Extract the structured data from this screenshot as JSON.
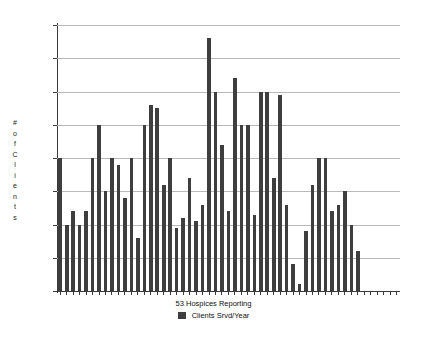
{
  "chart_data": {
    "type": "bar",
    "title": "",
    "xlabel": "53 Hospices Reporting",
    "ylabel": "# of Clients",
    "ylim": [
      0,
      400
    ],
    "ytick_labels": [
      "400",
      "350",
      "300",
      "250",
      "200",
      "150",
      "100",
      "50",
      "0"
    ],
    "ytick_values": [
      400,
      350,
      300,
      250,
      200,
      150,
      100,
      50,
      0
    ],
    "grid": true,
    "legend_position": "bottom-center",
    "legend": [
      "Clients Srvd/Year"
    ],
    "series": [
      {
        "name": "Clients Srvd/Year",
        "color": "#3e3e3e",
        "values": [
          200,
          100,
          120,
          100,
          120,
          200,
          250,
          150,
          200,
          190,
          140,
          200,
          80,
          250,
          280,
          275,
          160,
          200,
          95,
          110,
          170,
          105,
          130,
          380,
          300,
          220,
          120,
          320,
          250,
          250,
          115,
          300,
          300,
          170,
          295,
          130,
          40,
          10,
          90,
          160,
          200,
          200,
          120,
          130,
          150,
          100,
          60
        ]
      }
    ],
    "categories": [
      "1",
      "2",
      "3",
      "4",
      "5",
      "6",
      "7",
      "8",
      "9",
      "10",
      "11",
      "12",
      "13",
      "14",
      "15",
      "16",
      "17",
      "18",
      "19",
      "20",
      "21",
      "22",
      "23",
      "24",
      "25",
      "26",
      "27",
      "28",
      "29",
      "30",
      "31",
      "32",
      "33",
      "34",
      "35",
      "36",
      "37",
      "38",
      "39",
      "40",
      "41",
      "42",
      "43",
      "44",
      "45",
      "46",
      "47"
    ],
    "tick_count": 53
  },
  "axis": {
    "y_title_chars": [
      "#",
      "o",
      "f",
      "C",
      "l",
      "i",
      "e",
      "n",
      "t",
      "s"
    ]
  },
  "colors": {
    "bar": "#3e3e3e",
    "grid": "#b9b9b9",
    "axis": "#3a3a3a",
    "background": "#ffffff"
  }
}
